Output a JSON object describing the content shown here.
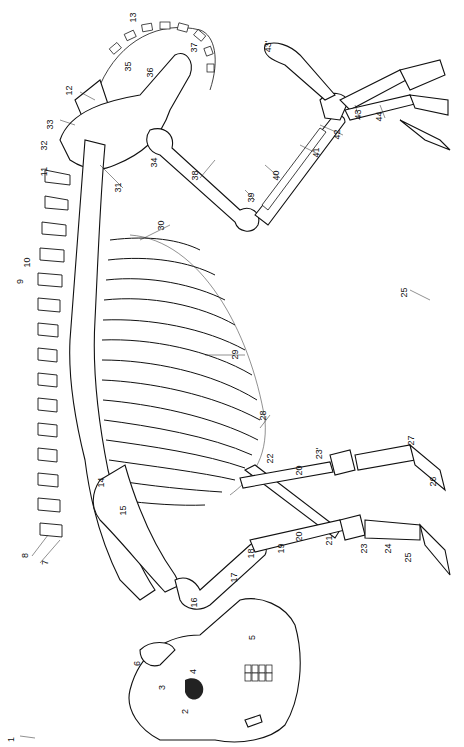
{
  "figure": {
    "orientation": "rotated-90-clockwise",
    "background": "#ffffff",
    "ink": "#111111"
  },
  "labels": [
    {
      "id": "1",
      "text": "1",
      "x": 14,
      "y": 740
    },
    {
      "id": "2",
      "text": "2",
      "x": 188,
      "y": 712
    },
    {
      "id": "3",
      "text": "3",
      "x": 165,
      "y": 688
    },
    {
      "id": "4",
      "text": "4",
      "x": 196,
      "y": 672
    },
    {
      "id": "5",
      "text": "5",
      "x": 255,
      "y": 638
    },
    {
      "id": "6",
      "text": "6",
      "x": 140,
      "y": 664
    },
    {
      "id": "7",
      "text": "7",
      "x": 48,
      "y": 563
    },
    {
      "id": "8",
      "text": "8",
      "x": 28,
      "y": 556
    },
    {
      "id": "14",
      "text": "14",
      "x": 103,
      "y": 483
    },
    {
      "id": "15",
      "text": "15",
      "x": 125,
      "y": 511
    },
    {
      "id": "16",
      "text": "16",
      "x": 196,
      "y": 603
    },
    {
      "id": "17",
      "text": "17",
      "x": 236,
      "y": 578
    },
    {
      "id": "18",
      "text": "18",
      "x": 253,
      "y": 554
    },
    {
      "id": "19",
      "text": "19",
      "x": 283,
      "y": 549
    },
    {
      "id": "20a",
      "text": "20",
      "x": 301,
      "y": 471
    },
    {
      "id": "20b",
      "text": "20",
      "x": 301,
      "y": 537
    },
    {
      "id": "21",
      "text": "21",
      "x": 331,
      "y": 541
    },
    {
      "id": "22",
      "text": "22",
      "x": 272,
      "y": 459
    },
    {
      "id": "23",
      "text": "23",
      "x": 366,
      "y": 549
    },
    {
      "id": "23p",
      "text": "23'",
      "x": 322,
      "y": 454
    },
    {
      "id": "24",
      "text": "24",
      "x": 390,
      "y": 549
    },
    {
      "id": "25a",
      "text": "25",
      "x": 410,
      "y": 558
    },
    {
      "id": "25b",
      "text": "25",
      "x": 406,
      "y": 293
    },
    {
      "id": "26",
      "text": "26",
      "x": 435,
      "y": 482
    },
    {
      "id": "27",
      "text": "27",
      "x": 413,
      "y": 441
    },
    {
      "id": "28",
      "text": "28",
      "x": 265,
      "y": 416
    },
    {
      "id": "29",
      "text": "29",
      "x": 237,
      "y": 355
    },
    {
      "id": "30",
      "text": "30",
      "x": 163,
      "y": 226
    },
    {
      "id": "31",
      "text": "31",
      "x": 120,
      "y": 188
    },
    {
      "id": "32",
      "text": "32",
      "x": 46,
      "y": 146
    },
    {
      "id": "33",
      "text": "33",
      "x": 52,
      "y": 125
    },
    {
      "id": "34",
      "text": "34",
      "x": 156,
      "y": 163
    },
    {
      "id": "35",
      "text": "35",
      "x": 130,
      "y": 67
    },
    {
      "id": "36",
      "text": "36",
      "x": 152,
      "y": 73
    },
    {
      "id": "37",
      "text": "37",
      "x": 196,
      "y": 48
    },
    {
      "id": "38",
      "text": "38",
      "x": 197,
      "y": 176
    },
    {
      "id": "39",
      "text": "39",
      "x": 253,
      "y": 198
    },
    {
      "id": "40",
      "text": "40",
      "x": 278,
      "y": 176
    },
    {
      "id": "41",
      "text": "41",
      "x": 318,
      "y": 153
    },
    {
      "id": "42",
      "text": "42",
      "x": 339,
      "y": 135
    },
    {
      "id": "43",
      "text": "43",
      "x": 360,
      "y": 115
    },
    {
      "id": "43p",
      "text": "43'",
      "x": 271,
      "y": 47
    },
    {
      "id": "44",
      "text": "44",
      "x": 381,
      "y": 117
    },
    {
      "id": "9",
      "text": "9",
      "x": 22,
      "y": 282
    },
    {
      "id": "10",
      "text": "10",
      "x": 29,
      "y": 263
    },
    {
      "id": "11",
      "text": "11",
      "x": 47,
      "y": 172
    },
    {
      "id": "12",
      "text": "12",
      "x": 71,
      "y": 91
    },
    {
      "id": "13",
      "text": "13",
      "x": 135,
      "y": 18
    }
  ]
}
